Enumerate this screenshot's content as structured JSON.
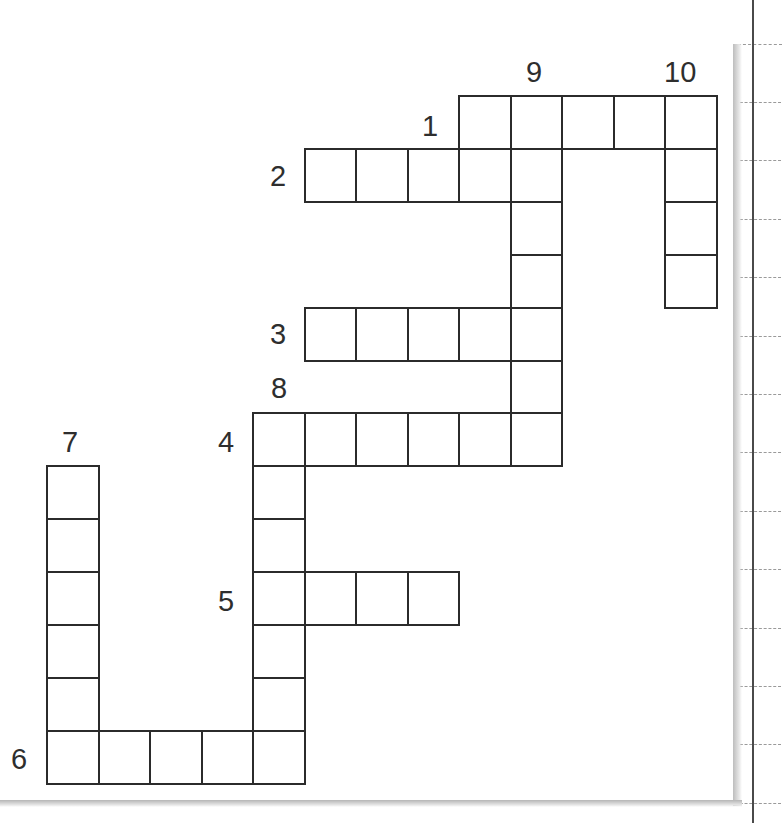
{
  "puzzle": {
    "type": "crossword",
    "grid_layout": {
      "origin_x": 47,
      "origin_y": 96,
      "cell_width": 51.5,
      "cell_height": 52.9,
      "columns": 13,
      "rows": 13
    },
    "clues": [
      {
        "number": "1",
        "direction": "across",
        "row": 0,
        "col": 8,
        "length": 5
      },
      {
        "number": "2",
        "direction": "across",
        "row": 1,
        "col": 5,
        "length": 5
      },
      {
        "number": "3",
        "direction": "across",
        "row": 4,
        "col": 5,
        "length": 5
      },
      {
        "number": "4",
        "direction": "across",
        "row": 6,
        "col": 4,
        "length": 6
      },
      {
        "number": "5",
        "direction": "across",
        "row": 9,
        "col": 4,
        "length": 4
      },
      {
        "number": "6",
        "direction": "across",
        "row": 12,
        "col": 0,
        "length": 5
      },
      {
        "number": "7",
        "direction": "down",
        "row": 7,
        "col": 0,
        "length": 6
      },
      {
        "number": "8",
        "direction": "down",
        "row": 6,
        "col": 4,
        "length": 7
      },
      {
        "number": "9",
        "direction": "down",
        "row": 0,
        "col": 9,
        "length": 7
      },
      {
        "number": "10",
        "direction": "down",
        "row": 0,
        "col": 12,
        "length": 4
      }
    ],
    "labels": [
      {
        "text": "9",
        "x": 526,
        "y": 58
      },
      {
        "text": "10",
        "x": 664,
        "y": 58
      },
      {
        "text": "1",
        "x": 422,
        "y": 112
      },
      {
        "text": "2",
        "x": 270,
        "y": 162
      },
      {
        "text": "3",
        "x": 270,
        "y": 320
      },
      {
        "text": "8",
        "x": 271,
        "y": 374
      },
      {
        "text": "7",
        "x": 62,
        "y": 428
      },
      {
        "text": "4",
        "x": 218,
        "y": 428
      },
      {
        "text": "5",
        "x": 218,
        "y": 587
      },
      {
        "text": "6",
        "x": 11,
        "y": 745
      }
    ],
    "cells": [
      [
        0,
        8
      ],
      [
        0,
        9
      ],
      [
        0,
        10
      ],
      [
        0,
        11
      ],
      [
        0,
        12
      ],
      [
        1,
        5
      ],
      [
        1,
        6
      ],
      [
        1,
        7
      ],
      [
        1,
        8
      ],
      [
        1,
        9
      ],
      [
        1,
        12
      ],
      [
        2,
        9
      ],
      [
        2,
        12
      ],
      [
        3,
        9
      ],
      [
        3,
        12
      ],
      [
        4,
        5
      ],
      [
        4,
        6
      ],
      [
        4,
        7
      ],
      [
        4,
        8
      ],
      [
        4,
        9
      ],
      [
        5,
        9
      ],
      [
        6,
        4
      ],
      [
        6,
        5
      ],
      [
        6,
        6
      ],
      [
        6,
        7
      ],
      [
        6,
        8
      ],
      [
        6,
        9
      ],
      [
        7,
        0
      ],
      [
        7,
        4
      ],
      [
        8,
        0
      ],
      [
        8,
        4
      ],
      [
        9,
        0
      ],
      [
        9,
        4
      ],
      [
        9,
        5
      ],
      [
        9,
        6
      ],
      [
        9,
        7
      ],
      [
        10,
        0
      ],
      [
        10,
        4
      ],
      [
        11,
        0
      ],
      [
        11,
        4
      ],
      [
        12,
        0
      ],
      [
        12,
        1
      ],
      [
        12,
        2
      ],
      [
        12,
        3
      ],
      [
        12,
        4
      ]
    ],
    "colors": {
      "grid_line": "#2b2b2b",
      "label": "#2e2e2e",
      "paper": "#ffffff",
      "notebook_rule": "#9a9a9a",
      "margin_line": "#4a4a4a"
    }
  },
  "notebook": {
    "ruled_lines_y": [
      102,
      160,
      219,
      277,
      336,
      394,
      452,
      511,
      569,
      628,
      686,
      744,
      803
    ]
  }
}
